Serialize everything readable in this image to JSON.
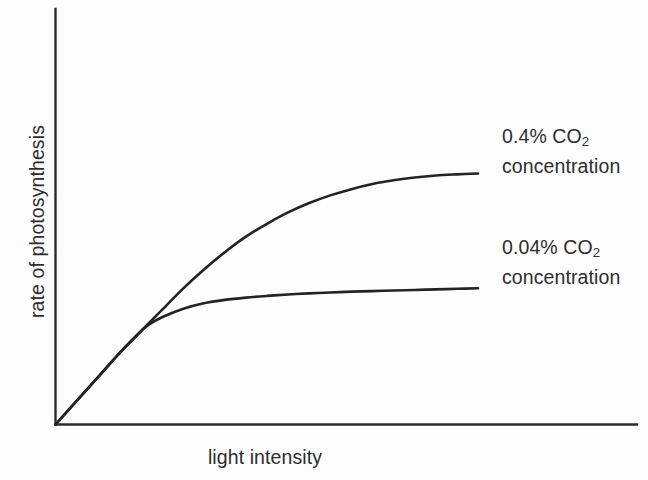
{
  "chart_data": {
    "type": "line",
    "title": "",
    "xlabel": "light intensity",
    "ylabel": "rate of photosynthesis",
    "grid": false,
    "axes": {
      "x_ticks": [],
      "y_ticks": [],
      "x_tick_labels": [],
      "y_tick_labels": [],
      "xlim": [
        0,
        1
      ],
      "ylim": [
        0,
        1
      ],
      "origin_note": "axes drawn as plain L-shaped lines with no tick marks or numeric scale"
    },
    "legend": {
      "position": "right-of-plot-inline-annotations",
      "entries": [
        {
          "name": "0.4% CO2 concentration",
          "line1": "0.4% CO",
          "line1_sub": "2",
          "line2": "concentration"
        },
        {
          "name": "0.04% CO2 concentration",
          "line1": "0.04% CO",
          "line1_sub": "2",
          "line2": "concentration"
        }
      ]
    },
    "series": [
      {
        "name": "0.4% CO2 concentration",
        "color": "#232323",
        "description": "light-limited linear rise from origin, then saturating to a high plateau",
        "x": [
          0.0,
          0.05,
          0.1,
          0.15,
          0.2,
          0.22,
          0.25,
          0.3,
          0.35,
          0.4,
          0.45,
          0.5,
          0.55,
          0.6,
          0.65,
          0.7,
          0.75,
          0.8,
          0.85,
          0.9,
          0.95,
          1.0
        ],
        "y": [
          0.0,
          0.083,
          0.166,
          0.249,
          0.325,
          0.355,
          0.4,
          0.475,
          0.543,
          0.605,
          0.66,
          0.705,
          0.745,
          0.778,
          0.805,
          0.827,
          0.845,
          0.858,
          0.868,
          0.875,
          0.879,
          0.882
        ]
      },
      {
        "name": "0.04% CO2 concentration",
        "color": "#232323",
        "description": "same initial light-limited slope, saturating early to a low plateau",
        "x": [
          0.0,
          0.05,
          0.1,
          0.15,
          0.2,
          0.22,
          0.25,
          0.3,
          0.35,
          0.4,
          0.45,
          0.5,
          0.55,
          0.6,
          0.65,
          0.7,
          0.75,
          0.8,
          0.85,
          0.9,
          0.95,
          1.0
        ],
        "y": [
          0.0,
          0.083,
          0.166,
          0.249,
          0.325,
          0.35,
          0.375,
          0.405,
          0.425,
          0.437,
          0.445,
          0.451,
          0.456,
          0.46,
          0.463,
          0.466,
          0.468,
          0.47,
          0.472,
          0.474,
          0.476,
          0.478
        ]
      }
    ],
    "annotations": [
      {
        "text": "both curves share an identical initial gradient where light is the limiting factor",
        "visible": false
      }
    ]
  },
  "figure": {
    "background_color": "#fdfdfd",
    "line_color": "#232323",
    "axis_color": "#2b2b2b",
    "text_color": "#2d2d2d"
  }
}
